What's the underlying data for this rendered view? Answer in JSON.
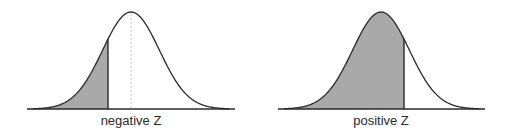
{
  "diagrams": [
    {
      "id": "negative",
      "label": "negative Z",
      "center_x": 131,
      "cut_x": 108,
      "axis": [
        27,
        235
      ],
      "shaded": "left",
      "show_mean_line": true
    },
    {
      "id": "positive",
      "label": "positive Z",
      "center_x": 381,
      "cut_x": 404,
      "axis": [
        278,
        485
      ],
      "shaded": "left",
      "show_mean_line": false
    }
  ],
  "style": {
    "baseline_y": 109,
    "peak_y": 12,
    "sigma_px": 28.4,
    "fill_color": "#a9a9a9",
    "stroke_color": "#2a2a2a",
    "mean_line_color": "#c8c8c8"
  }
}
